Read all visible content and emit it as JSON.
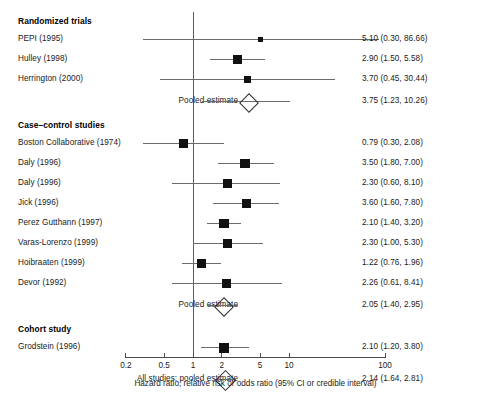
{
  "chart_data": {
    "type": "forest",
    "title": "",
    "xlabel": "Hazard ratio, relative risk or odds ratio (95% CI or credible interval)",
    "ylabel": "",
    "scale": "log",
    "xlim": [
      0.2,
      100
    ],
    "reference_line": 1,
    "ticks": [
      {
        "label": "0.2",
        "value": 0.2
      },
      {
        "label": "0.5",
        "value": 0.5
      },
      {
        "label": "1",
        "value": 1
      },
      {
        "label": "2",
        "value": 2
      },
      {
        "label": "5",
        "value": 5
      },
      {
        "label": "10",
        "value": 10
      },
      {
        "label": "100",
        "value": 100
      }
    ],
    "groups": [
      {
        "heading": "Randomized trials",
        "rows": [
          {
            "study": "PEPI (1995)",
            "estimate": 5.1,
            "low": 0.3,
            "high": 86.66,
            "text": "5.10 (0.30, 86.66)",
            "marker": "square",
            "size": 5.0
          },
          {
            "study": "Hulley (1998)",
            "estimate": 2.9,
            "low": 1.5,
            "high": 5.58,
            "text": "2.90 (1.50, 5.58)",
            "marker": "square",
            "size": 9.0
          },
          {
            "study": "Herrington (2000)",
            "estimate": 3.7,
            "low": 0.45,
            "high": 30.44,
            "text": "3.70 (0.45, 30.44)",
            "marker": "square",
            "size": 7.0
          }
        ],
        "pooled": {
          "study": "Pooled estimate",
          "estimate": 3.75,
          "low": 1.23,
          "high": 10.26,
          "text": "3.75 (1.23, 10.26)",
          "marker": "diamond"
        }
      },
      {
        "heading": "Case–control studies",
        "rows": [
          {
            "study": "Boston Collaborative (1974)",
            "estimate": 0.79,
            "low": 0.3,
            "high": 2.08,
            "text": "0.79 (0.30, 2.08)",
            "marker": "square",
            "size": 9.0
          },
          {
            "study": "Daly (1996)",
            "estimate": 3.5,
            "low": 1.8,
            "high": 7.0,
            "text": "3.50 (1.80, 7.00)",
            "marker": "square",
            "size": 9.5
          },
          {
            "study": "Daly (1996)",
            "estimate": 2.3,
            "low": 0.6,
            "high": 8.1,
            "text": "2.30 (0.60, 8.10)",
            "marker": "square",
            "size": 9.0
          },
          {
            "study": "Jick (1996)",
            "estimate": 3.6,
            "low": 1.6,
            "high": 7.8,
            "text": "3.60 (1.60, 7.80)",
            "marker": "square",
            "size": 9.5
          },
          {
            "study": "Perez Gutthann (1997)",
            "estimate": 2.1,
            "low": 1.4,
            "high": 3.2,
            "text": "2.10 (1.40, 3.20)",
            "marker": "square",
            "size": 9.5
          },
          {
            "study": "Varas-Lorenzo (1999)",
            "estimate": 2.3,
            "low": 1.0,
            "high": 5.3,
            "text": "2.30 (1.00, 5.30)",
            "marker": "square",
            "size": 9.5
          },
          {
            "study": "Hoibraaten (1999)",
            "estimate": 1.22,
            "low": 0.76,
            "high": 1.96,
            "text": "1.22 (0.76, 1.96)",
            "marker": "square",
            "size": 9.5
          },
          {
            "study": "Devor (1992)",
            "estimate": 2.26,
            "low": 0.61,
            "high": 8.41,
            "text": "2.26 (0.61, 8.41)",
            "marker": "square",
            "size": 9.0
          }
        ],
        "pooled": {
          "study": "Pooled estimate",
          "estimate": 2.05,
          "low": 1.4,
          "high": 2.95,
          "text": "2.05 (1.40, 2.95)",
          "marker": "diamond"
        }
      },
      {
        "heading": "Cohort study",
        "rows": [
          {
            "study": "Grodstein (1996)",
            "estimate": 2.1,
            "low": 1.2,
            "high": 3.8,
            "text": "2.10 (1.20, 3.80)",
            "marker": "square",
            "size": 10.0
          }
        ],
        "pooled": null
      }
    ],
    "overall": {
      "study": "All studies: pooled estimate",
      "estimate": 2.14,
      "low": 1.64,
      "high": 2.81,
      "text": "2.14 (1.64, 2.81)",
      "marker": "diamond"
    }
  },
  "colors": {
    "marker": "#111111",
    "line": "#6b6b6b",
    "axis": "#4a4a4a",
    "reference": "#5d5d5d",
    "text": "#1a1a1a",
    "background": "#ffffff"
  }
}
